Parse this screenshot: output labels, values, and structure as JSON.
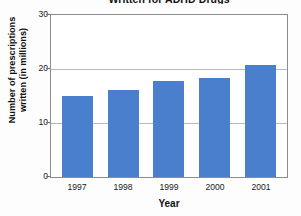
{
  "chart_data": {
    "type": "bar",
    "title": "Written for ADHD Drugs",
    "xlabel": "Year",
    "ylabel_line1": "Number of prescriptions",
    "ylabel_line2": "written (in millions)",
    "categories": [
      "1997",
      "1998",
      "1999",
      "2000",
      "2001"
    ],
    "values": [
      15.0,
      16.2,
      17.8,
      18.4,
      20.7
    ],
    "ylim": [
      0,
      30
    ],
    "yticks": [
      "0",
      "10",
      "20",
      "30"
    ],
    "ytick_values": [
      0,
      10,
      20,
      30
    ],
    "grid": "horizontal",
    "legend": "none",
    "bar_color": "#4a7fce",
    "axis_color": "#8c8c8c",
    "grid_color": "#b9b9b9"
  }
}
